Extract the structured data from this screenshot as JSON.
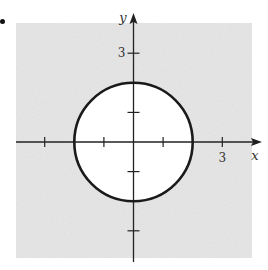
{
  "marker": "•",
  "chart_data": {
    "type": "region",
    "title": "",
    "xlabel": "x",
    "ylabel": "y",
    "xlim": [
      -4,
      4
    ],
    "ylim": [
      -4,
      4
    ],
    "x_ticks": [
      -3,
      -1,
      1,
      3
    ],
    "y_ticks": [
      -3,
      -1,
      1,
      3
    ],
    "x_tick_labels": [
      {
        "value": 3,
        "label": "3"
      }
    ],
    "y_tick_labels": [
      {
        "value": 3,
        "label": "3"
      }
    ],
    "boundary": {
      "shape": "circle",
      "center": [
        0,
        0
      ],
      "radius": 2,
      "line": "solid"
    },
    "shaded_region": "outside",
    "grid": false,
    "colors": {
      "shade": "#e6e6e6",
      "axis": "#222222",
      "boundary": "#1a1a1a",
      "inside": "#ffffff"
    }
  }
}
